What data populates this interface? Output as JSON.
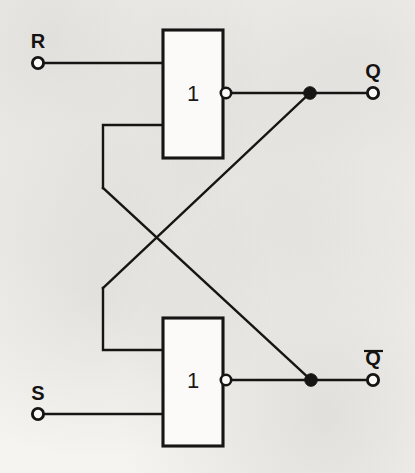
{
  "diagram": {
    "type": "logic-circuit-schematic",
    "colors": {
      "ink": "#161514",
      "paper": "#f4f3f1",
      "gate_fill": "#fbfaf8"
    },
    "gates": [
      {
        "id": "gate-top",
        "label": "1",
        "symbol_standard": "IEC",
        "function": "NOR",
        "inverted_output": true,
        "box": {
          "x": 163,
          "y": 30,
          "width": 60,
          "height": 128
        },
        "label_pos": {
          "x": 193,
          "y": 94
        },
        "bubble": {
          "cx": 226,
          "cy": 93,
          "r": 5.2
        },
        "inputs": [
          {
            "name": "input-R",
            "x": 163,
            "y": 63
          },
          {
            "name": "input-feedback-top",
            "x": 163,
            "y": 125
          }
        ],
        "output": {
          "name": "output-Q",
          "x": 231,
          "y": 93
        }
      },
      {
        "id": "gate-bottom",
        "label": "1",
        "symbol_standard": "IEC",
        "function": "NOR",
        "inverted_output": true,
        "box": {
          "x": 163,
          "y": 318,
          "width": 60,
          "height": 128
        },
        "label_pos": {
          "x": 193,
          "y": 381
        },
        "bubble": {
          "cx": 226,
          "cy": 380,
          "r": 5.2
        },
        "inputs": [
          {
            "name": "input-feedback-bottom",
            "x": 163,
            "y": 350
          },
          {
            "name": "input-S",
            "x": 163,
            "y": 414
          }
        ],
        "output": {
          "name": "output-Qbar",
          "x": 231,
          "y": 380
        }
      }
    ],
    "terminals": [
      {
        "name": "terminal-R",
        "label": "R",
        "overbar": false,
        "cx": 38,
        "cy": 63,
        "r": 5.6,
        "label_x": 38,
        "label_y": 48
      },
      {
        "name": "terminal-S",
        "label": "S",
        "overbar": false,
        "cx": 38,
        "cy": 414,
        "r": 5.6,
        "label_x": 38,
        "label_y": 400
      },
      {
        "name": "terminal-Q",
        "label": "Q",
        "overbar": false,
        "cx": 373,
        "cy": 93,
        "r": 5.6,
        "label_x": 373,
        "label_y": 78
      },
      {
        "name": "terminal-Qbar",
        "label": "Q",
        "overbar": true,
        "cx": 373,
        "cy": 380,
        "r": 5.6,
        "label_x": 373,
        "label_y": 365,
        "overbar_x1": 364,
        "overbar_x2": 383,
        "overbar_y": 351
      }
    ],
    "junctions": [
      {
        "name": "junction-Q",
        "cx": 310,
        "cy": 93,
        "r": 6.3
      },
      {
        "name": "junction-Qbar",
        "cx": 311,
        "cy": 380,
        "r": 6.3
      }
    ],
    "wires": [
      {
        "name": "wire-R-to-gate-top",
        "points": "44,63 163,63"
      },
      {
        "name": "wire-S-to-gate-bottom",
        "points": "44,414 163,414"
      },
      {
        "name": "wire-Q-out-to-terminal",
        "points": "231,93 373,93"
      },
      {
        "name": "wire-Qbar-out-to-terminal",
        "points": "231,380 373,380"
      },
      {
        "name": "wire-feedback-top-input",
        "points": "163,125 103,125 103,188"
      },
      {
        "name": "wire-feedback-bottom-input",
        "points": "163,350 103,350 103,288"
      },
      {
        "name": "wire-cross-Qbar-to-top",
        "points": "103,188 311,380"
      },
      {
        "name": "wire-cross-Q-to-bottom",
        "points": "310,93 103,288"
      }
    ]
  }
}
